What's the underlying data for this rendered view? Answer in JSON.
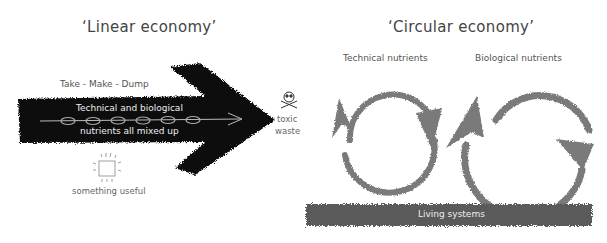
{
  "linear": {
    "title": "‘Linear economy’",
    "slogan": "Take - Make - Dump",
    "arrow_text_top": "Technical and biological",
    "arrow_text_bottom": "nutrients all mixed up",
    "product_label": "something useful",
    "waste_label_1": "toxic",
    "waste_label_2": "waste",
    "icons": {
      "skull": "skull-and-crossbones-icon",
      "product": "glowing-box-icon"
    },
    "nutrient_count": 6
  },
  "circular": {
    "title": "‘Circular economy’",
    "technical_label": "Technical nutrients",
    "biological_label": "Biological nutrients",
    "living_systems_label": "Living systems"
  },
  "colors": {
    "arrow_black": "#111111",
    "cycle_gray": "#7a7a7a",
    "living_band": "#5a5a5a",
    "text_gray": "#444444",
    "background": "#ffffff"
  }
}
